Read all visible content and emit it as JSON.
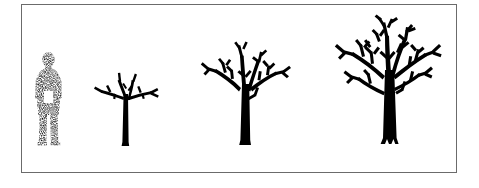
{
  "figure": {
    "type": "illustration",
    "background_color": "#ffffff",
    "frame": {
      "border_color": "#6b6b6b",
      "border_width_px": 1,
      "fill_color": "#ffffff",
      "x": 21,
      "y": 4,
      "width": 436,
      "height": 169
    },
    "baseline_y": 149,
    "subjects": [
      {
        "id": "human-figure",
        "name": "human figure",
        "kind": "scale-reference",
        "render_style": "stippled-dotted-silhouette",
        "color": "#9a9a9a",
        "height_px": 95,
        "width_px": 30,
        "x": 37,
        "caption": ""
      },
      {
        "id": "tree-stage-1",
        "name": "young tree",
        "kind": "tree",
        "stage": 1,
        "render_style": "solid-silhouette",
        "color": "#000000",
        "height_px": 84,
        "canopy_width_px": 72,
        "trunk_width_px": 6,
        "branch_orders": 2,
        "x": 93,
        "caption": ""
      },
      {
        "id": "tree-stage-2",
        "name": "medium tree",
        "kind": "tree",
        "stage": 2,
        "render_style": "solid-silhouette",
        "color": "#000000",
        "height_px": 110,
        "canopy_width_px": 102,
        "trunk_width_px": 9,
        "branch_orders": 3,
        "x": 198,
        "caption": ""
      },
      {
        "id": "tree-stage-3",
        "name": "mature tree",
        "kind": "tree",
        "stage": 3,
        "render_style": "solid-silhouette",
        "color": "#000000",
        "height_px": 134,
        "canopy_width_px": 120,
        "trunk_width_px": 12,
        "branch_orders": 4,
        "x": 333,
        "caption": ""
      }
    ]
  }
}
